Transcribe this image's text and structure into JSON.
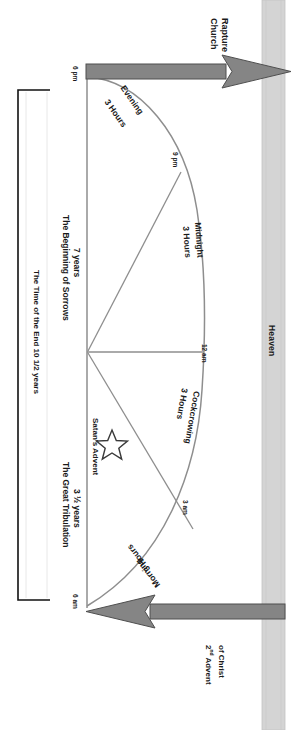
{
  "diagram": {
    "title_labels": {
      "heaven": "Heaven",
      "church_rapture_l1": "Church",
      "church_rapture_l2": "Rapture",
      "second_advent_l1": "2",
      "second_advent_sup": "nd",
      "second_advent_l1b": " Advent",
      "second_advent_l2": "of Christ"
    },
    "time_marks": {
      "start": "6 pm",
      "nine_pm": "9 pm",
      "twelve_am": "12 am",
      "three_am": "3 am",
      "end": "6 am"
    },
    "watches": [
      {
        "name": "Evening",
        "duration": "3 Hours"
      },
      {
        "name": "Midnight",
        "duration": "3 Hours"
      },
      {
        "name": "Cockcrowing",
        "duration": "3 Hours"
      },
      {
        "name": "Morning",
        "duration": "3 Hours"
      }
    ],
    "periods": {
      "sorrows_l1": "The Beginning of Sorrows",
      "sorrows_l2": "7 years",
      "tribulation_l1": "The Great Tribulation",
      "tribulation_l2": "3 ½ years",
      "time_of_end": "The Time of the End  10 1/2 years"
    },
    "events": {
      "satans_advent": "Satan's Advent",
      "star_icon": "star-icon"
    },
    "colors": {
      "heaven_bar": "#d3d3d3",
      "arrow_fill": "#7f7f7f",
      "arrow_stroke": "#4d4d4d",
      "curve_stroke": "#8c8c8c",
      "bracket_stroke": "#000000",
      "text": "#1a1a1a"
    }
  }
}
